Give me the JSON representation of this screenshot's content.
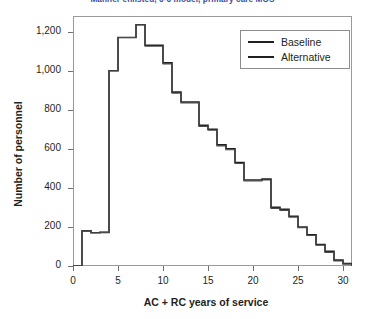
{
  "chart_data": {
    "type": "line",
    "title": "Manner enlisted, 6-6 model, primary care MOS",
    "xlabel": "AC + RC years of service",
    "ylabel": "Number of personnel",
    "xlim": [
      0,
      31
    ],
    "ylim": [
      0,
      1280
    ],
    "xticks": [
      0,
      5,
      10,
      15,
      20,
      25,
      30
    ],
    "xtick_labels": [
      "0",
      "5",
      "10",
      "15",
      "20",
      "25",
      "30"
    ],
    "yticks": [
      0,
      200,
      400,
      600,
      800,
      1000,
      1200
    ],
    "ytick_labels": [
      "0",
      "200",
      "400",
      "600",
      "800",
      "1,000",
      "1,200"
    ],
    "grid": false,
    "drawstyle": "steps-post",
    "legend_position": "upper right",
    "legend_entries": [
      "Baseline",
      "Alternative"
    ],
    "x": [
      0,
      1,
      2,
      3,
      4,
      5,
      6,
      7,
      8,
      9,
      10,
      11,
      12,
      13,
      14,
      15,
      16,
      17,
      18,
      19,
      20,
      21,
      22,
      23,
      24,
      25,
      26,
      27,
      28,
      29,
      30,
      31
    ],
    "series": [
      {
        "name": "Baseline",
        "color": "#231f20",
        "values": [
          0,
          180,
          170,
          172,
          1000,
          1170,
          1170,
          1235,
          1130,
          1130,
          1040,
          890,
          840,
          840,
          720,
          700,
          620,
          600,
          530,
          440,
          440,
          445,
          300,
          290,
          255,
          200,
          160,
          110,
          75,
          30,
          12,
          0
        ]
      },
      {
        "name": "Alternative",
        "color": "#4a4a4a",
        "values": [
          0,
          180,
          170,
          172,
          1000,
          1170,
          1170,
          1235,
          1125,
          1125,
          1035,
          885,
          835,
          835,
          715,
          695,
          615,
          595,
          525,
          435,
          435,
          440,
          295,
          285,
          250,
          196,
          156,
          106,
          70,
          26,
          10,
          0
        ]
      }
    ]
  }
}
